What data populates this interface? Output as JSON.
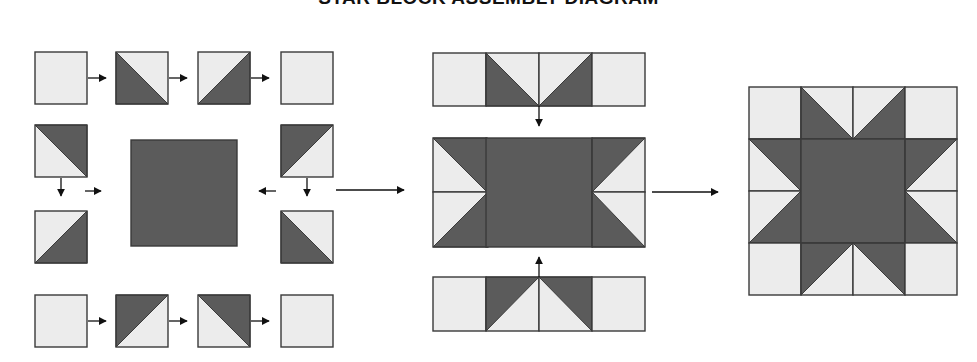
{
  "title": "STAR BLOCK ASSEMBLY DIAGRAM",
  "colors": {
    "dark": "#5b5b5b",
    "light": "#ececec",
    "stroke": "#3a3a3a",
    "arrow": "#111111"
  },
  "legend_note": "Dark = star fabric, Light = background fabric",
  "steps": [
    {
      "name": "step-1-units",
      "description": "Sew units into rows: top row, bottom row, left and right side pairs, center square",
      "units": [
        {
          "id": "top-1",
          "x": 35,
          "y": 52,
          "s": 52,
          "type": "plain"
        },
        {
          "id": "top-2",
          "x": 116,
          "y": 52,
          "s": 52,
          "type": "hst",
          "dark": "bl"
        },
        {
          "id": "top-3",
          "x": 198,
          "y": 52,
          "s": 52,
          "type": "hst",
          "dark": "br"
        },
        {
          "id": "top-4",
          "x": 281,
          "y": 52,
          "s": 52,
          "type": "plain"
        },
        {
          "id": "left-1",
          "x": 35,
          "y": 125,
          "s": 52,
          "type": "hst",
          "dark": "tr"
        },
        {
          "id": "left-2",
          "x": 35,
          "y": 211,
          "s": 52,
          "type": "hst",
          "dark": "br"
        },
        {
          "id": "right-1",
          "x": 281,
          "y": 125,
          "s": 52,
          "type": "hst",
          "dark": "tl"
        },
        {
          "id": "right-2",
          "x": 281,
          "y": 211,
          "s": 52,
          "type": "hst",
          "dark": "bl"
        },
        {
          "id": "bottom-1",
          "x": 35,
          "y": 295,
          "s": 52,
          "type": "plain"
        },
        {
          "id": "bottom-2",
          "x": 116,
          "y": 295,
          "s": 52,
          "type": "hst",
          "dark": "tl"
        },
        {
          "id": "bottom-3",
          "x": 198,
          "y": 295,
          "s": 52,
          "type": "hst",
          "dark": "tr"
        },
        {
          "id": "bottom-4",
          "x": 281,
          "y": 295,
          "s": 52,
          "type": "plain"
        },
        {
          "id": "center",
          "x": 131,
          "y": 140,
          "s": 106,
          "type": "solid"
        }
      ],
      "arrows": [
        {
          "x1": 88,
          "y1": 78,
          "x2": 106,
          "y2": 78
        },
        {
          "x1": 169,
          "y1": 78,
          "x2": 187,
          "y2": 78
        },
        {
          "x1": 251,
          "y1": 78,
          "x2": 269,
          "y2": 78
        },
        {
          "x1": 88,
          "y1": 321,
          "x2": 106,
          "y2": 321
        },
        {
          "x1": 169,
          "y1": 321,
          "x2": 187,
          "y2": 321
        },
        {
          "x1": 251,
          "y1": 321,
          "x2": 269,
          "y2": 321
        },
        {
          "x1": 61,
          "y1": 178,
          "x2": 61,
          "y2": 196
        },
        {
          "x1": 307,
          "y1": 178,
          "x2": 307,
          "y2": 196
        },
        {
          "x1": 85,
          "y1": 191,
          "x2": 101,
          "y2": 191
        },
        {
          "x1": 276,
          "y1": 191,
          "x2": 259,
          "y2": 191
        }
      ]
    },
    {
      "name": "step-2-rows",
      "description": "Join rows: top star-point row, middle row, bottom star-point row",
      "units": [
        {
          "id": "r1-1",
          "x": 433,
          "y": 53,
          "s": 53,
          "type": "plain"
        },
        {
          "id": "r1-2",
          "x": 486,
          "y": 53,
          "s": 53,
          "type": "hst",
          "dark": "bl"
        },
        {
          "id": "r1-3",
          "x": 539,
          "y": 53,
          "s": 53,
          "type": "hst",
          "dark": "br"
        },
        {
          "id": "r1-4",
          "x": 592,
          "y": 53,
          "s": 53,
          "type": "plain"
        },
        {
          "id": "m-l1",
          "x": 433,
          "y": 138,
          "s": 54,
          "type": "hst",
          "dark": "tr"
        },
        {
          "id": "m-l2",
          "x": 433,
          "y": 192,
          "s": 55,
          "type": "hst",
          "dark": "br"
        },
        {
          "id": "m-c",
          "x": 486,
          "y": 138,
          "s": 106,
          "type": "solid",
          "h": 109
        },
        {
          "id": "m-r1",
          "x": 592,
          "y": 138,
          "s": 53,
          "type": "hst",
          "dark": "tl",
          "h": 54
        },
        {
          "id": "m-r2",
          "x": 592,
          "y": 192,
          "s": 53,
          "type": "hst",
          "dark": "bl",
          "h": 55
        },
        {
          "id": "r3-1",
          "x": 433,
          "y": 277,
          "s": 53,
          "type": "plain",
          "h": 54
        },
        {
          "id": "r3-2",
          "x": 486,
          "y": 277,
          "s": 53,
          "type": "hst",
          "dark": "tl",
          "h": 54
        },
        {
          "id": "r3-3",
          "x": 539,
          "y": 277,
          "s": 53,
          "type": "hst",
          "dark": "tr",
          "h": 54
        },
        {
          "id": "r3-4",
          "x": 592,
          "y": 277,
          "s": 53,
          "type": "plain",
          "h": 54
        }
      ],
      "arrows": [
        {
          "x1": 539,
          "y1": 106,
          "x2": 539,
          "y2": 126
        },
        {
          "x1": 539,
          "y1": 277,
          "x2": 539,
          "y2": 257
        }
      ]
    },
    {
      "name": "step-3-finished-block",
      "description": "Finished star block",
      "units": [
        {
          "id": "f-1",
          "x": 749,
          "y": 87,
          "s": 52,
          "type": "plain"
        },
        {
          "id": "f-2",
          "x": 801,
          "y": 87,
          "s": 52,
          "type": "hst",
          "dark": "bl"
        },
        {
          "id": "f-3",
          "x": 853,
          "y": 87,
          "s": 52,
          "type": "hst",
          "dark": "br"
        },
        {
          "id": "f-4",
          "x": 905,
          "y": 87,
          "s": 52,
          "type": "plain"
        },
        {
          "id": "f-5",
          "x": 749,
          "y": 139,
          "s": 52,
          "type": "hst",
          "dark": "tr"
        },
        {
          "id": "f-6",
          "x": 749,
          "y": 191,
          "s": 52,
          "type": "hst",
          "dark": "br"
        },
        {
          "id": "f-c",
          "x": 801,
          "y": 139,
          "s": 104,
          "type": "solid"
        },
        {
          "id": "f-7",
          "x": 905,
          "y": 139,
          "s": 52,
          "type": "hst",
          "dark": "tl"
        },
        {
          "id": "f-8",
          "x": 905,
          "y": 191,
          "s": 52,
          "type": "hst",
          "dark": "bl"
        },
        {
          "id": "f-9",
          "x": 749,
          "y": 243,
          "s": 52,
          "type": "plain"
        },
        {
          "id": "f-10",
          "x": 801,
          "y": 243,
          "s": 52,
          "type": "hst",
          "dark": "tl"
        },
        {
          "id": "f-11",
          "x": 853,
          "y": 243,
          "s": 52,
          "type": "hst",
          "dark": "tr"
        },
        {
          "id": "f-12",
          "x": 905,
          "y": 243,
          "s": 52,
          "type": "plain"
        }
      ],
      "arrows": []
    }
  ],
  "flow_arrows": [
    {
      "name": "step-1-to-step-2-arrow",
      "x1": 336,
      "y1": 190,
      "x2": 404,
      "y2": 190
    },
    {
      "name": "step-2-to-step-3-arrow",
      "x1": 652,
      "y1": 192,
      "x2": 718,
      "y2": 192
    }
  ]
}
